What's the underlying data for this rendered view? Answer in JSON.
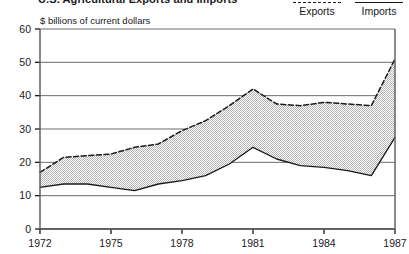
{
  "title": {
    "text": "U.S. Agricultural Exports and Imports",
    "cropped": true
  },
  "legend": {
    "position": "top-right",
    "items": [
      {
        "label": "Exports",
        "style": "dashed",
        "color": "#1a1a1a"
      },
      {
        "label": "Imports",
        "style": "solid",
        "color": "#1a1a1a"
      }
    ]
  },
  "axis": {
    "y_unit_label": "$ billions of current dollars",
    "y_ticks": [
      "60",
      "50",
      "40",
      "30",
      "20",
      "10",
      "0"
    ],
    "x_ticks": [
      "1972",
      "1975",
      "1978",
      "1981",
      "1984",
      "1987"
    ]
  },
  "colors": {
    "line": "#1a1a1a",
    "fill": "#d6d6d6",
    "grid": "#6b6b6b",
    "background": "#ffffff"
  },
  "chart_data": {
    "type": "area",
    "title": "U.S. Agricultural Exports and Imports",
    "xlabel": "",
    "ylabel": "$ billions of current dollars",
    "xlim": [
      1972,
      1987
    ],
    "ylim": [
      0,
      60
    ],
    "ytick_values": [
      0,
      10,
      20,
      30,
      40,
      50,
      60
    ],
    "xtick_values": [
      1972,
      1975,
      1978,
      1981,
      1984,
      1987
    ],
    "grid": true,
    "legend_position": "top-right",
    "x": [
      1972,
      1973,
      1974,
      1975,
      1976,
      1977,
      1978,
      1979,
      1980,
      1981,
      1982,
      1983,
      1984,
      1985,
      1986,
      1987
    ],
    "series": [
      {
        "name": "Exports",
        "style": "dashed",
        "values": [
          17.0,
          21.5,
          22.0,
          22.5,
          24.5,
          25.5,
          29.5,
          32.5,
          37.0,
          42.0,
          37.5,
          37.0,
          38.0,
          37.5,
          37.0,
          51.0
        ]
      },
      {
        "name": "Imports",
        "style": "solid",
        "values": [
          12.5,
          13.5,
          13.5,
          12.5,
          11.5,
          13.5,
          14.5,
          16.0,
          19.5,
          24.5,
          21.0,
          19.0,
          18.5,
          17.5,
          16.0,
          27.5
        ]
      }
    ]
  }
}
